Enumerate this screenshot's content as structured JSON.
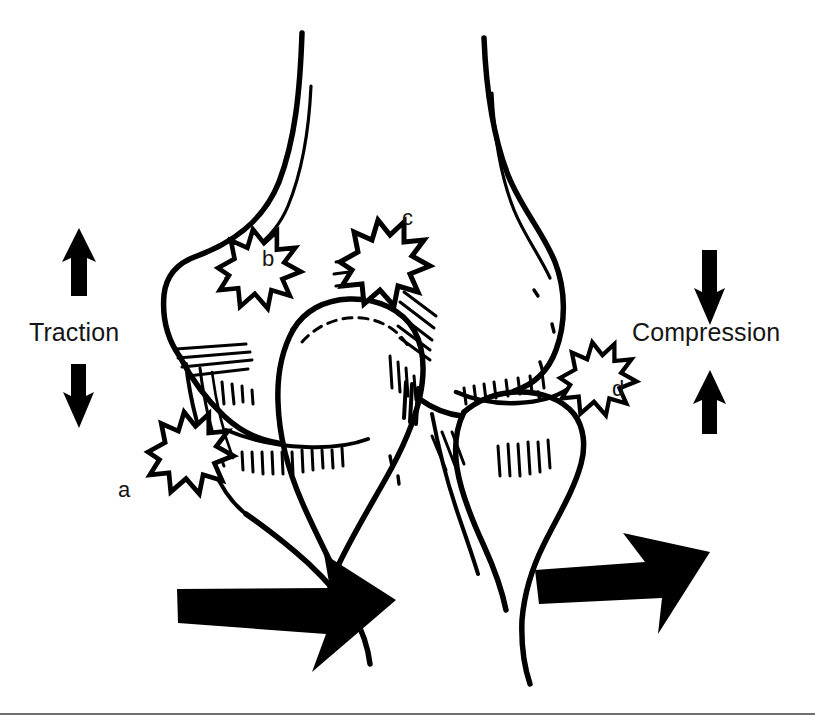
{
  "figure": {
    "type": "anatomical-line-drawing",
    "background_color": "#ffffff",
    "ink_color": "#000000",
    "width": 815,
    "height": 726
  },
  "force_labels": {
    "traction": "Traction",
    "compression": "Compression"
  },
  "site_labels": {
    "a": "a",
    "b": "b",
    "c": "c",
    "d": "d"
  },
  "arrows": {
    "traction_up": {
      "direction": "up",
      "color": "#000000",
      "side": "left"
    },
    "traction_down": {
      "direction": "down",
      "color": "#000000",
      "side": "left"
    },
    "compression_down": {
      "direction": "down",
      "color": "#000000",
      "side": "right"
    },
    "compression_up": {
      "direction": "up",
      "color": "#000000",
      "side": "right"
    },
    "shear_left": {
      "direction": "right",
      "color": "#000000",
      "position": "bottom-left"
    },
    "shear_right": {
      "direction": "right",
      "color": "#000000",
      "position": "bottom-right"
    }
  },
  "rule": {
    "color": "#6e6e6e"
  }
}
